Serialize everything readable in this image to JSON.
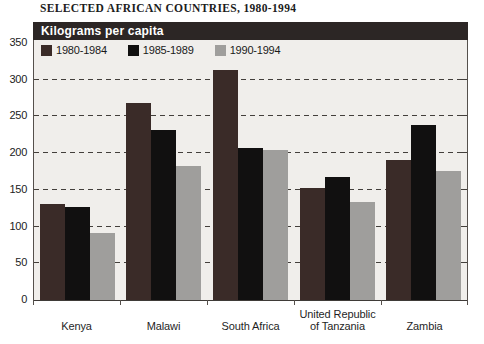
{
  "page": {
    "title": "SELECTED AFRICAN COUNTRIES, 1980-1994"
  },
  "colors": {
    "panel_header_bg": "#2c2625",
    "panel_header_text": "#ffffff",
    "plot_background": "#f0eeeb",
    "axis": "#55504c",
    "gridline": "#433f3b",
    "series_1980_1984": "#3a2b28",
    "series_1985_1989": "#111010",
    "series_1990_1994": "#9f9e9c"
  },
  "chart_data": {
    "type": "bar",
    "title": "SELECTED AFRICAN COUNTRIES, 1980-1994",
    "panel_header": "Kilograms per capita",
    "categories": [
      "Kenya",
      "Malawi",
      "South Africa",
      "United Republic of Tanzania",
      "Zambia"
    ],
    "series": [
      {
        "name": "1980-1984",
        "color": "#3a2b28",
        "values": [
          131,
          268,
          313,
          152,
          190
        ]
      },
      {
        "name": "1985-1989",
        "color": "#111010",
        "values": [
          126,
          232,
          207,
          168,
          238
        ]
      },
      {
        "name": "1990-1994",
        "color": "#9f9e9c",
        "values": [
          91,
          183,
          204,
          133,
          175
        ]
      }
    ],
    "xlabel": "",
    "ylabel": "Kilograms per capita",
    "ylim": [
      0,
      350
    ],
    "yticks": [
      0,
      50,
      100,
      150,
      200,
      250,
      300,
      350
    ],
    "grid": "horizontal dashed lines every 50 units",
    "legend_position": "top-left inside plot, single row"
  }
}
